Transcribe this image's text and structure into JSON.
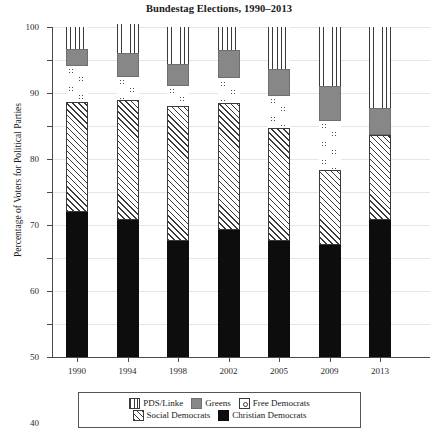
{
  "chart_data": {
    "type": "bar",
    "subtype": "stacked",
    "title": "Bundestag Elections, 1990–2013",
    "xlabel": "",
    "ylabel": "Percentage of Voters for Political Parties",
    "ylim": [
      0,
      100
    ],
    "yticks": [
      0,
      10,
      20,
      30,
      40,
      50,
      60,
      70,
      80,
      90,
      100
    ],
    "grid": true,
    "legend_position": "bottom",
    "categories": [
      "1990",
      "1994",
      "1998",
      "2002",
      "2005",
      "2009",
      "2013"
    ],
    "series": [
      {
        "name": "Christian Democrats",
        "pattern": "solid-black",
        "color": "#0d0d0d",
        "values": [
          43.8,
          41.5,
          35.1,
          38.5,
          35.2,
          33.8,
          41.5
        ]
      },
      {
        "name": "Social Democrats",
        "pattern": "diagonal-hatch",
        "color": "#3a3a3a",
        "values": [
          33.5,
          36.4,
          40.9,
          38.5,
          34.2,
          23.0,
          25.7
        ]
      },
      {
        "name": "Free Democrats",
        "pattern": "open-circles",
        "color": "#4a4a4a",
        "values": [
          11.0,
          6.9,
          6.2,
          7.4,
          9.8,
          14.6,
          0.0
        ]
      },
      {
        "name": "Greens",
        "pattern": "solid-gray",
        "color": "#878787",
        "values": [
          5.1,
          7.3,
          6.7,
          8.6,
          8.1,
          10.7,
          8.4
        ]
      },
      {
        "name": "PDS/Linke",
        "pattern": "vertical-lines",
        "color": "#3a3a3a",
        "values": [
          6.6,
          8.9,
          11.1,
          7.0,
          12.7,
          17.9,
          24.4
        ]
      }
    ]
  },
  "legend": {
    "row1": [
      {
        "label": "PDS/Linke",
        "swatch": "pds-swatch-icon"
      },
      {
        "label": "Greens",
        "swatch": "greens-swatch-icon"
      },
      {
        "label": "Free Democrats",
        "swatch": "fdp-swatch-icon"
      }
    ],
    "row2": [
      {
        "label": "Social Democrats",
        "swatch": "spd-swatch-icon"
      },
      {
        "label": "Christian Democrats",
        "swatch": "cdu-swatch-icon"
      }
    ]
  }
}
